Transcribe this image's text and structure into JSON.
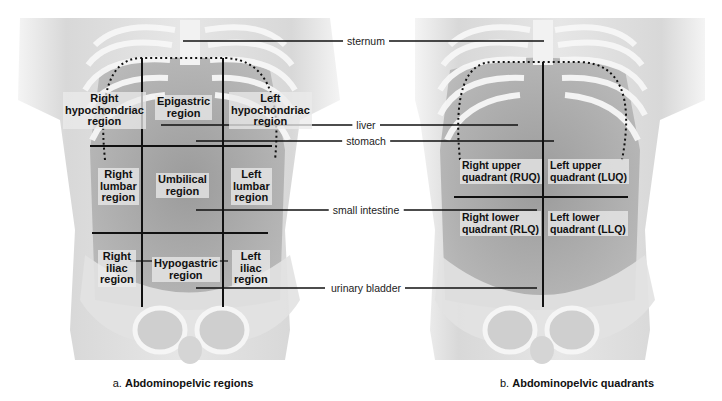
{
  "panel_a": {
    "caption_prefix": "a.",
    "caption_title": "Abdominopelvic regions",
    "regions": [
      {
        "id": "right-hypochondriac",
        "lines": [
          "Right",
          "hypochondriac",
          "region"
        ]
      },
      {
        "id": "epigastric",
        "lines": [
          "Epigastric",
          "region"
        ]
      },
      {
        "id": "left-hypochondriac",
        "lines": [
          "Left",
          "hypochondriac",
          "region"
        ]
      },
      {
        "id": "right-lumbar",
        "lines": [
          "Right",
          "lumbar",
          "region"
        ]
      },
      {
        "id": "umbilical",
        "lines": [
          "Umbilical",
          "region"
        ]
      },
      {
        "id": "left-lumbar",
        "lines": [
          "Left",
          "lumbar",
          "region"
        ]
      },
      {
        "id": "right-iliac",
        "lines": [
          "Right",
          "iliac",
          "region"
        ]
      },
      {
        "id": "hypogastric",
        "lines": [
          "Hypogastric",
          "region"
        ]
      },
      {
        "id": "left-iliac",
        "lines": [
          "Left",
          "iliac",
          "region"
        ]
      }
    ]
  },
  "panel_b": {
    "caption_prefix": "b.",
    "caption_title": "Abdominopelvic quadrants",
    "quadrants": [
      {
        "id": "ruq",
        "lines": [
          "Right upper",
          "quadrant (RUQ)"
        ]
      },
      {
        "id": "luq",
        "lines": [
          "Left upper",
          "quadrant (LUQ)"
        ]
      },
      {
        "id": "rlq",
        "lines": [
          "Right lower",
          "quadrant (RLQ)"
        ]
      },
      {
        "id": "llq",
        "lines": [
          "Left lower",
          "quadrant (LLQ)"
        ]
      }
    ]
  },
  "callouts": [
    {
      "id": "sternum",
      "label": "sternum"
    },
    {
      "id": "liver",
      "label": "liver"
    },
    {
      "id": "stomach",
      "label": "stomach"
    },
    {
      "id": "small-intestine",
      "label": "small intestine"
    },
    {
      "id": "urinary-bladder",
      "label": "urinary bladder"
    }
  ],
  "colors": {
    "line": "#111111",
    "skin": "#d9d9d9",
    "bone": "#f2f2f2",
    "organ": "#9a9a9a"
  }
}
